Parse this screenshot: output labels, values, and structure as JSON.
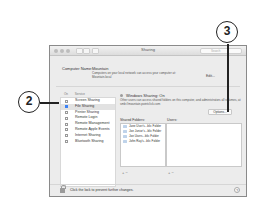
{
  "window": {
    "title": "Sharing",
    "search_placeholder": "Search"
  },
  "computer_name": {
    "label": "Computer Name:",
    "value": "Mountain",
    "description": "Computers on your local network can access your computer at: Mountain.local",
    "edit_label": "Edit..."
  },
  "services": {
    "header_on": "On",
    "header_service": "Service",
    "items": [
      {
        "label": "Screen Sharing",
        "checked": false,
        "selected": false
      },
      {
        "label": "File Sharing",
        "checked": true,
        "selected": true
      },
      {
        "label": "Printer Sharing",
        "checked": false,
        "selected": false
      },
      {
        "label": "Remote Login",
        "checked": false,
        "selected": false
      },
      {
        "label": "Remote Management",
        "checked": false,
        "selected": false
      },
      {
        "label": "Remote Apple Events",
        "checked": false,
        "selected": false
      },
      {
        "label": "Internet Sharing",
        "checked": false,
        "selected": false
      },
      {
        "label": "Bluetooth Sharing",
        "checked": false,
        "selected": false
      }
    ]
  },
  "detail": {
    "status": "Windows Sharing: On",
    "status_desc": "Other users can access shared folders on this computer, and administrators all volumes, at smb://mountain.pointclick.com",
    "options_label": "Options...",
    "shared_folders_label": "Shared Folders:",
    "users_label": "Users:",
    "shared_folders": [
      "Jane User's...blic Folder",
      "Joe Junior's...blic Folder",
      "Joe Users...blic Folder",
      "John Ray's...blic Folder"
    ],
    "add_remove": "+ −"
  },
  "footer": {
    "lock_text": "Click the lock to prevent further changes.",
    "help": "?"
  },
  "callouts": {
    "two": "2",
    "three": "3"
  }
}
